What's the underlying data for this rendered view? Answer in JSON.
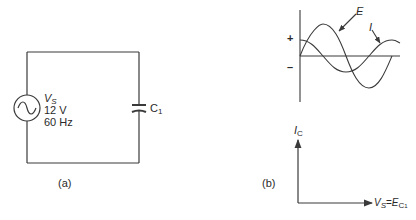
{
  "figure_a": {
    "caption": "(a)",
    "source": {
      "name": "V",
      "name_sub": "S",
      "voltage": "12 V",
      "frequency": "60 Hz",
      "symbol": "ac-source-icon"
    },
    "capacitor": {
      "name": "C",
      "name_sub": "1",
      "symbol": "capacitor-icon"
    }
  },
  "figure_b": {
    "caption": "(b)",
    "waveform": {
      "plus_label": "+",
      "minus_label": "–",
      "voltage_label": "E",
      "current_label": "I",
      "voltage_phase": "sine (0°)",
      "current_phase": "leads by 90°"
    },
    "phasor": {
      "y_label": "I",
      "y_label_sub": "C",
      "x_label_left": "V",
      "x_label_left_sub": "S",
      "x_label_eq": "=",
      "x_label_right": "E",
      "x_label_right_sub": "C",
      "x_label_right_subsub": "1"
    }
  },
  "colors": {
    "line": "#3a3a3a",
    "background": "#ffffff"
  }
}
